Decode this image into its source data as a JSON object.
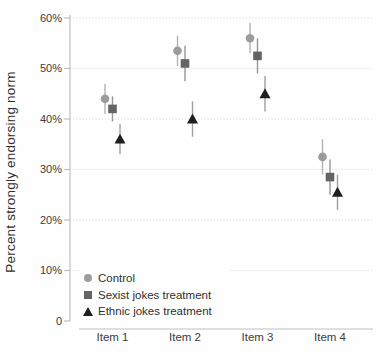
{
  "chart_data": {
    "type": "scatter",
    "title": "",
    "xlabel": "",
    "ylabel": "Percent strongly endorsing norm",
    "ylim": [
      0,
      60
    ],
    "grid": "horizontal-dotted",
    "legend_position": "bottom-left-inside",
    "yticks": [
      {
        "value": 0,
        "label": "0"
      },
      {
        "value": 10,
        "label": "10%"
      },
      {
        "value": 20,
        "label": "20%"
      },
      {
        "value": 30,
        "label": "30%"
      },
      {
        "value": 40,
        "label": "40%"
      },
      {
        "value": 50,
        "label": "50%"
      },
      {
        "value": 60,
        "label": "60%"
      }
    ],
    "categories": [
      "Item 1",
      "Item 2",
      "Item 3",
      "Item 4"
    ],
    "series": [
      {
        "name": "Control",
        "marker": "circle",
        "color": "#9c9c9c",
        "errorbar_color": "#b2b2b2",
        "values": [
          44,
          53.5,
          56,
          32.5
        ],
        "ci_low": [
          41,
          50.5,
          53,
          29
        ],
        "ci_high": [
          47,
          56.5,
          59,
          36
        ]
      },
      {
        "name": "Sexist jokes treatment",
        "marker": "square",
        "color": "#646464",
        "errorbar_color": "#979797",
        "values": [
          42,
          51,
          52.5,
          28.5
        ],
        "ci_low": [
          39.5,
          47.5,
          49,
          25
        ],
        "ci_high": [
          44.5,
          54.5,
          56,
          32
        ]
      },
      {
        "name": "Ethnic jokes treatment",
        "marker": "triangle",
        "color": "#1e1e1e",
        "errorbar_color": "#a0a0a0",
        "values": [
          36,
          40,
          45,
          25.5
        ],
        "ci_low": [
          33,
          36.5,
          41.5,
          22
        ],
        "ci_high": [
          39,
          43.5,
          48.5,
          29
        ]
      }
    ],
    "colors": {
      "axis": "#bfbfbf",
      "gridline": "#d6d6d6",
      "tick_text": "#3c3c3c"
    }
  }
}
